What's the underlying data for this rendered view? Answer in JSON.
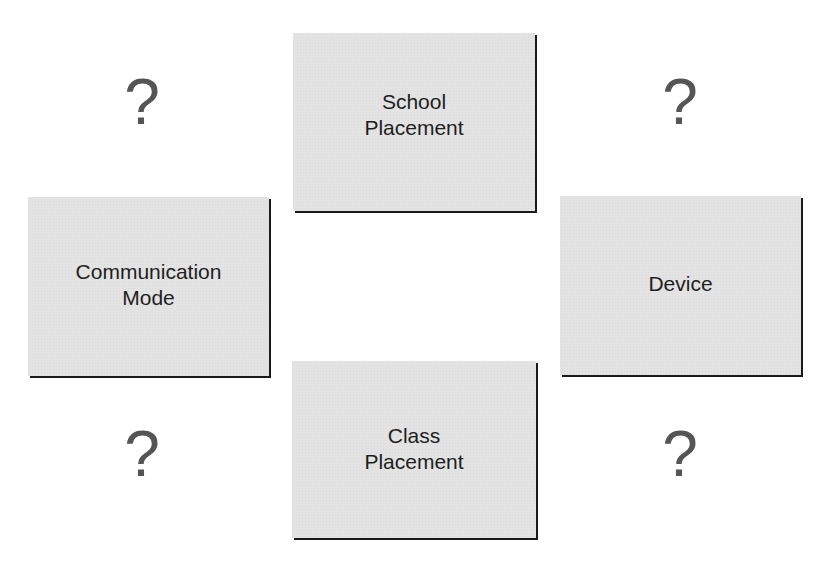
{
  "diagram": {
    "boxes": {
      "top": {
        "label": "School\nPlacement"
      },
      "left": {
        "label": "Communication\nMode"
      },
      "right": {
        "label": "Device"
      },
      "bottom": {
        "label": "Class\nPlacement"
      }
    },
    "question_marks": {
      "top_left": "?",
      "top_right": "?",
      "bottom_left": "?",
      "bottom_right": "?"
    },
    "colors": {
      "background": "#ffffff",
      "box_fill": "#e3e3e3",
      "box_shadow": "#1a1a1a",
      "label_text": "#1e1e1e",
      "question_mark": "#555555"
    }
  }
}
